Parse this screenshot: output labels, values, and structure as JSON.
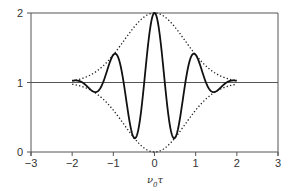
{
  "chart_data": {
    "type": "line",
    "title": "",
    "xlabel": "ν0τ",
    "xlabel_main": "ν",
    "xlabel_sub": "0",
    "xlabel_tail": "τ",
    "ylabel": "",
    "xlim": [
      -3,
      3
    ],
    "ylim": [
      0,
      2
    ],
    "xticks": [
      "-3",
      "-2",
      "-1",
      "0",
      "1",
      "2",
      "3"
    ],
    "yticks": [
      "0",
      "1",
      "2"
    ],
    "grid": false,
    "reference_line_y": 1,
    "series": [
      {
        "name": "signal",
        "style": "solid",
        "x": [
          -2.0,
          -1.9,
          -1.4,
          -0.95,
          -0.5,
          0.0,
          0.5,
          0.95,
          1.4,
          1.9,
          2.0
        ],
        "y": [
          1.02,
          1.03,
          0.88,
          1.4,
          0.21,
          2.0,
          0.21,
          1.4,
          0.88,
          1.03,
          1.02
        ]
      },
      {
        "name": "upper envelope",
        "style": "dotted",
        "x": [
          -2.0,
          -1.0,
          0.0,
          1.0,
          2.0
        ],
        "y": [
          1.0,
          1.4,
          2.0,
          1.4,
          1.0
        ]
      },
      {
        "name": "lower envelope",
        "style": "dotted",
        "x": [
          -2.0,
          -1.0,
          0.0,
          1.0,
          2.0
        ],
        "y": [
          1.0,
          0.6,
          0.0,
          0.6,
          1.0
        ]
      }
    ]
  },
  "colors": {
    "line": "#111111",
    "axis": "#555555",
    "text": "#333333"
  }
}
